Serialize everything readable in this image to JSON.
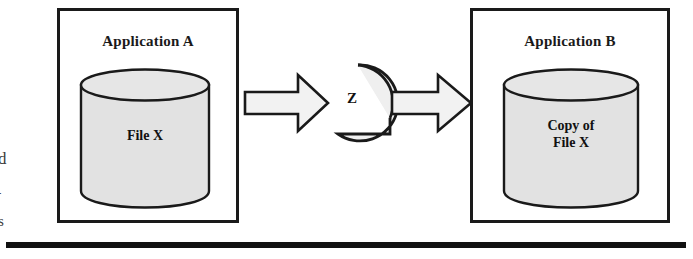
{
  "diagram": {
    "colors": {
      "stroke": "#1a1a1a",
      "cylinder_fill": "#e2e2e2",
      "arrow_fill": "#f2f2f2",
      "circle_fill": "#efefef",
      "background": "#ffffff",
      "rule": "#111111"
    },
    "left_box": {
      "title": "Application A",
      "cylinder_label": "File X",
      "cylinder_name": "database-cylinder"
    },
    "right_box": {
      "title": "Application B",
      "cylinder_label": "Copy of\nFile X",
      "cylinder_name": "database-cylinder"
    },
    "process": {
      "label": "Z",
      "shape": "circle-with-tail",
      "in_arrow": "right-arrow",
      "out_arrow": "right-arrow"
    },
    "rule": {
      "name": "horizontal-rule"
    },
    "edge_text": {
      "glyph_1": "d",
      "glyph_2": "-",
      "glyph_3": "s"
    }
  }
}
